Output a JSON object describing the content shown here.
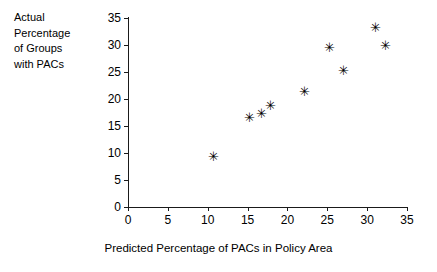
{
  "chart_data": {
    "type": "scatter",
    "title": "",
    "xlabel": "Predicted Percentage of PACs in Policy Area",
    "ylabel": "Actual Percentage of Groups with PACs",
    "ylabel_lines": [
      "Actual",
      "Percentage",
      "of Groups",
      "with PACs"
    ],
    "xlim": [
      0,
      35
    ],
    "ylim": [
      0,
      35
    ],
    "xticks": [
      0,
      5,
      10,
      15,
      20,
      25,
      30,
      35
    ],
    "yticks": [
      0,
      5,
      10,
      15,
      20,
      25,
      30,
      35
    ],
    "xtick_labels": [
      "0",
      "5",
      "10",
      "15",
      "20",
      "25",
      "30",
      "35"
    ],
    "ytick_labels": [
      "0",
      "5",
      "10",
      "15",
      "20",
      "25",
      "30",
      "35"
    ],
    "grid": false,
    "legend": null,
    "marker": "asterisk",
    "marker_color": "#000000",
    "axis_color": "#1a1a1a",
    "points": [
      {
        "x": 10.7,
        "y": 9.4
      },
      {
        "x": 15.3,
        "y": 16.7
      },
      {
        "x": 16.8,
        "y": 17.5
      },
      {
        "x": 17.9,
        "y": 18.8
      },
      {
        "x": 22.1,
        "y": 21.5
      },
      {
        "x": 25.3,
        "y": 29.6
      },
      {
        "x": 27.0,
        "y": 25.4
      },
      {
        "x": 31.0,
        "y": 33.4
      },
      {
        "x": 32.3,
        "y": 30.0
      }
    ],
    "marker_glyph": "✳"
  }
}
